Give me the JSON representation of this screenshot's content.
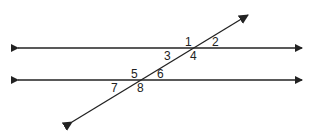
{
  "diagram": {
    "parallel_lines": [
      {
        "name": "upper-line",
        "y": 48,
        "x1": 10,
        "x2": 310
      },
      {
        "name": "lower-line",
        "y": 80,
        "x1": 10,
        "x2": 310
      }
    ],
    "transversal": {
      "x1": 68,
      "y1": 125,
      "x2": 252,
      "y2": 12
    },
    "angle_labels": [
      {
        "id": "1",
        "text": "1",
        "x": 185,
        "y": 46
      },
      {
        "id": "2",
        "text": "2",
        "x": 212,
        "y": 46
      },
      {
        "id": "3",
        "text": "3",
        "x": 164,
        "y": 60
      },
      {
        "id": "4",
        "text": "4",
        "x": 190,
        "y": 60
      },
      {
        "id": "5",
        "text": "5",
        "x": 131,
        "y": 78
      },
      {
        "id": "6",
        "text": "6",
        "x": 157,
        "y": 78
      },
      {
        "id": "7",
        "text": "7",
        "x": 111,
        "y": 92
      },
      {
        "id": "8",
        "text": "8",
        "x": 137,
        "y": 92
      }
    ],
    "colors": {
      "line": "#222222",
      "background": "#ffffff"
    }
  }
}
